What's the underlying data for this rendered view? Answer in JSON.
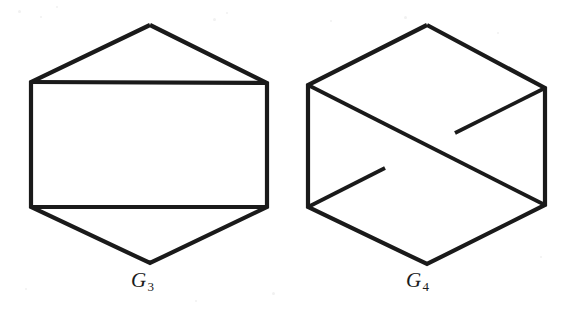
{
  "plate": {
    "width": 574,
    "height": 315,
    "background_color": "#ffffff",
    "ink_color": "#1a1a1a"
  },
  "figures": [
    {
      "id": "G3",
      "caption_letter": "G",
      "caption_subscript": "3",
      "caption_text": "G3",
      "description": "planar hexagonal graph with a horizontal rectangle chord pair",
      "vertices": [
        {
          "name": "top-apex",
          "x": 150,
          "y": 25
        },
        {
          "name": "upper-left",
          "x": 31,
          "y": 82
        },
        {
          "name": "upper-right",
          "x": 267,
          "y": 83
        },
        {
          "name": "lower-left",
          "x": 31,
          "y": 207
        },
        {
          "name": "lower-right",
          "x": 267,
          "y": 207
        },
        {
          "name": "bottom-apex",
          "x": 150,
          "y": 263
        }
      ],
      "edges": [
        {
          "name": "outline",
          "points": "150,25 31,82 31,207 150,263 267,207 267,83 150,25",
          "style": "continuous"
        },
        {
          "name": "upper-chord",
          "points": "31,82 267,83",
          "style": "continuous"
        },
        {
          "name": "lower-chord",
          "points": "31,207 267,207",
          "style": "continuous"
        }
      ],
      "crossings": 0
    },
    {
      "id": "G4",
      "caption_letter": "G",
      "caption_subscript": "4",
      "caption_text": "G4",
      "description": "hexagonal graph with two crossing diagonals, one drawn broken at the crossing",
      "vertices": [
        {
          "name": "top-apex",
          "x": 427,
          "y": 25
        },
        {
          "name": "upper-left",
          "x": 308,
          "y": 85
        },
        {
          "name": "upper-right",
          "x": 545,
          "y": 88
        },
        {
          "name": "lower-left",
          "x": 308,
          "y": 207
        },
        {
          "name": "lower-right",
          "x": 545,
          "y": 205
        },
        {
          "name": "bottom-apex",
          "x": 427,
          "y": 264
        }
      ],
      "edges": [
        {
          "name": "outline",
          "points": "427,25 308,85 308,207 427,264 545,205 545,88 427,25",
          "style": "continuous"
        },
        {
          "name": "main-diagonal",
          "points": "308,85 545,205",
          "style": "continuous"
        },
        {
          "name": "anti-diagonal-lower-segment",
          "points": "308,207 385,168",
          "style": "broken"
        },
        {
          "name": "anti-diagonal-upper-segment",
          "points": "455,133 545,88",
          "style": "broken"
        }
      ],
      "crossings": 1,
      "crossing_point": {
        "x": 420,
        "y": 150
      }
    }
  ],
  "specks": [
    {
      "x": 18,
      "y": 10,
      "size": 3
    },
    {
      "x": 40,
      "y": 16,
      "size": 2
    },
    {
      "x": 56,
      "y": 6,
      "size": 2
    },
    {
      "x": 213,
      "y": 18,
      "size": 3
    },
    {
      "x": 226,
      "y": 12,
      "size": 2
    },
    {
      "x": 330,
      "y": 20,
      "size": 2
    },
    {
      "x": 404,
      "y": 16,
      "size": 3
    },
    {
      "x": 497,
      "y": 32,
      "size": 2
    },
    {
      "x": 540,
      "y": 256,
      "size": 2
    },
    {
      "x": 25,
      "y": 288,
      "size": 2
    },
    {
      "x": 272,
      "y": 292,
      "size": 3
    },
    {
      "x": 195,
      "y": 300,
      "size": 2
    }
  ]
}
